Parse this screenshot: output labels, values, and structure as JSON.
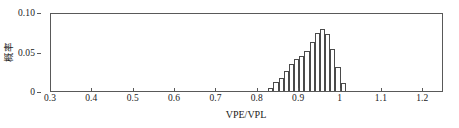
{
  "chart_data": {
    "type": "bar",
    "title": "",
    "subtitle": "",
    "xlabel": "VPE/VPL",
    "ylabel": "概率",
    "xlim": [
      0.3,
      1.25
    ],
    "ylim": [
      0.0,
      0.1
    ],
    "grid": false,
    "legend": null,
    "bin_width": 0.0125,
    "x_tick_labels": [
      "0.3",
      "0.4",
      "0.5",
      "0.6",
      "0.7",
      "0.8",
      "0.9",
      "1",
      "1.1",
      "1.2"
    ],
    "x_tick_values": [
      0.3,
      0.4,
      0.5,
      0.6,
      0.7,
      0.8,
      0.9,
      1.0,
      1.1,
      1.2
    ],
    "y_tick_labels": [
      "0",
      "0.05",
      "0.10"
    ],
    "y_tick_values": [
      0.0,
      0.05,
      0.1
    ],
    "bin_left_edges": [
      0.825,
      0.8375,
      0.85,
      0.8625,
      0.875,
      0.8875,
      0.9,
      0.9125,
      0.925,
      0.9375,
      0.95,
      0.9625,
      0.975,
      0.9875
    ],
    "bin_centers": [
      0.83125,
      0.84375,
      0.85625,
      0.86875,
      0.88125,
      0.89375,
      0.90625,
      0.91875,
      0.93125,
      0.94375,
      0.95625,
      0.96875,
      0.98125,
      0.99375
    ],
    "values": [
      0.004,
      0.011,
      0.017,
      0.025,
      0.034,
      0.041,
      0.044,
      0.051,
      0.062,
      0.073,
      0.078,
      0.072,
      0.053,
      0.031
    ],
    "series": [
      {
        "name": "VPE/VPL distribution",
        "values": [
          0.004,
          0.011,
          0.017,
          0.025,
          0.034,
          0.041,
          0.044,
          0.051,
          0.062,
          0.073,
          0.078,
          0.072,
          0.053,
          0.031
        ]
      }
    ],
    "tail_bar": {
      "center": 1.00625,
      "value": 0.01
    },
    "colors": {
      "bar_fill": "#ffffff",
      "bar_edge": "#4a4a4a",
      "axis": "#595959",
      "text": "#1a1a1a",
      "background": "#ffffff"
    }
  }
}
